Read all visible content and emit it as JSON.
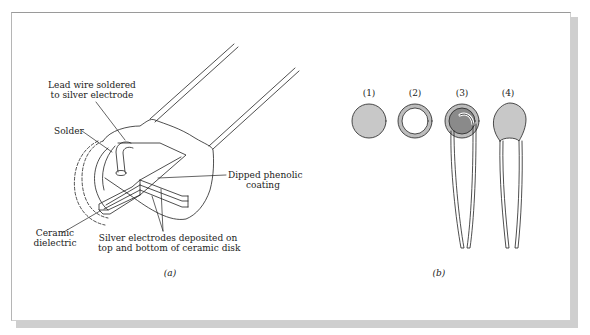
{
  "figure": {
    "panel_a": {
      "caption": "(a)",
      "labels": {
        "lead_wire_line1": "Lead wire soldered",
        "lead_wire_line2": "to silver electrode",
        "solder": "Solder",
        "dipped_line1": "Dipped phenolic",
        "dipped_line2": "coating",
        "ceramic_line1": "Ceramic",
        "ceramic_line2": "dielectric",
        "silver_line1": "Silver electrodes deposited on",
        "silver_line2": "top and bottom of ceramic disk"
      }
    },
    "panel_b": {
      "caption": "(b)",
      "stages": [
        {
          "label": "(1)",
          "description": "ceramic disk"
        },
        {
          "label": "(2)",
          "description": "disk with silver electrode ring"
        },
        {
          "label": "(3)",
          "description": "disk with soldered lead wires"
        },
        {
          "label": "(4)",
          "description": "dipped coated capacitor"
        }
      ]
    },
    "colors": {
      "disk_fill": "#c8c8c8",
      "electrode_fill": "#8a8a8a",
      "ring_fill": "#bdbdbd",
      "line": "#222222",
      "shadow": "#cfcfcf"
    }
  }
}
